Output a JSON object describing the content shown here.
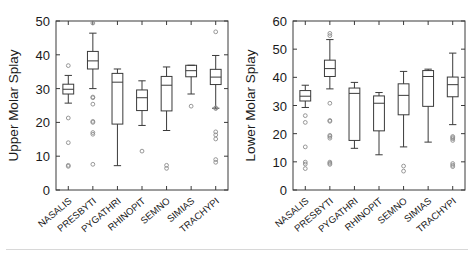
{
  "figure": {
    "title": "",
    "panel_count": 2,
    "background": "#ffffff",
    "line_color": "#3a3a3a"
  },
  "panels": [
    {
      "id": "upper-molar-splay",
      "ylabel": "Upper Molar Splay",
      "xlabel": "",
      "yticks": [
        "0",
        "10",
        "20",
        "30",
        "40",
        "50"
      ],
      "ylim": [
        0,
        50
      ],
      "categories": [
        "NASALIS",
        "PRESBYTI",
        "PYGATHRI",
        "RHINOPIT",
        "SEMNO",
        "SIMIAS",
        "TRACHYPI"
      ]
    },
    {
      "id": "lower-molar-splay",
      "ylabel": "Lower Molar Splay",
      "xlabel": "",
      "yticks": [
        "0",
        "10",
        "20",
        "30",
        "40",
        "50",
        "60"
      ],
      "ylim": [
        0,
        60
      ],
      "categories": [
        "NASALIS",
        "PRESBYTI",
        "PYGATHRI",
        "RHINOPIT",
        "SEMNO",
        "SIMIAS",
        "TRACHYPI"
      ]
    }
  ],
  "chart_data": [
    {
      "type": "boxplot",
      "title": "Upper Molar Splay",
      "xlabel": "",
      "ylabel": "Upper Molar Splay",
      "ylim": [
        0,
        50
      ],
      "yticks": [
        0,
        10,
        20,
        30,
        40,
        50
      ],
      "grid": false,
      "legend": null,
      "categories": [
        "NASALIS",
        "PRESBYTI",
        "PYGATHRI",
        "RHINOPIT",
        "SEMNO",
        "SIMIAS",
        "TRACHYPI"
      ],
      "boxes": [
        {
          "name": "NASALIS",
          "whisker_low": 25.7,
          "q1": 28.4,
          "median": 29.8,
          "q3": 31.3,
          "whisker_high": 33.9,
          "outliers": [
            36.8,
            21.3,
            14.0,
            7.3,
            7.0
          ]
        },
        {
          "name": "PRESBYTI",
          "whisker_low": 30.0,
          "q1": 35.8,
          "median": 38.2,
          "q3": 41.0,
          "whisker_high": 46.4,
          "outliers": [
            49.4,
            27.5,
            27.3,
            25.4,
            20.3,
            20.0,
            17.0,
            16.5,
            7.6
          ]
        },
        {
          "name": "PYGATHRI",
          "whisker_low": 7.2,
          "q1": 19.5,
          "median": 31.9,
          "q3": 34.5,
          "whisker_high": 35.8,
          "outliers": []
        },
        {
          "name": "RHINOPIT",
          "whisker_low": 19.1,
          "q1": 23.5,
          "median": 27.3,
          "q3": 29.6,
          "whisker_high": 32.3,
          "outliers": [
            11.5
          ]
        },
        {
          "name": "SEMNO",
          "whisker_low": 17.6,
          "q1": 23.4,
          "median": 31.0,
          "q3": 33.6,
          "whisker_high": 36.4,
          "outliers": [
            7.3,
            6.4
          ]
        },
        {
          "name": "SIMIAS",
          "whisker_low": 28.4,
          "q1": 33.5,
          "median": 35.3,
          "q3": 36.9,
          "whisker_high": 36.9,
          "outliers": [
            24.8
          ]
        },
        {
          "name": "TRACHYPI",
          "whisker_low": 24.2,
          "q1": 31.2,
          "median": 33.4,
          "q3": 35.7,
          "whisker_high": 39.8,
          "outliers": [
            46.8,
            24.3,
            24.1,
            17.2,
            16.3,
            15.1,
            9.0,
            8.2
          ]
        }
      ]
    },
    {
      "type": "boxplot",
      "title": "Lower Molar Splay",
      "xlabel": "",
      "ylabel": "Lower Molar Splay",
      "ylim": [
        0,
        60
      ],
      "yticks": [
        0,
        10,
        20,
        30,
        40,
        50,
        60
      ],
      "grid": false,
      "legend": null,
      "categories": [
        "NASALIS",
        "PRESBYTI",
        "PYGATHRI",
        "RHINOPIT",
        "SEMNO",
        "SIMIAS",
        "TRACHYPI"
      ],
      "boxes": [
        {
          "name": "NASALIS",
          "whisker_low": 29.3,
          "q1": 31.6,
          "median": 33.3,
          "q3": 35.3,
          "whisker_high": 37.2,
          "outliers": [
            26.4,
            24.0,
            15.3,
            9.9,
            9.2,
            7.6
          ]
        },
        {
          "name": "PRESBYTI",
          "whisker_low": 35.9,
          "q1": 40.3,
          "median": 43.1,
          "q3": 46.1,
          "whisker_high": 53.4,
          "outliers": [
            55.6,
            54.8,
            30.8,
            24.7,
            24.4,
            19.4,
            19.0,
            18.4,
            9.9,
            9.5,
            9.1
          ]
        },
        {
          "name": "PYGATHRI",
          "whisker_low": 14.8,
          "q1": 17.6,
          "median": 34.3,
          "q3": 36.2,
          "whisker_high": 38.2,
          "outliers": []
        },
        {
          "name": "RHINOPIT",
          "whisker_low": 12.5,
          "q1": 21.0,
          "median": 30.8,
          "q3": 33.4,
          "whisker_high": 34.6,
          "outliers": []
        },
        {
          "name": "SEMNO",
          "whisker_low": 15.3,
          "q1": 26.7,
          "median": 33.6,
          "q3": 37.7,
          "whisker_high": 42.1,
          "outliers": [
            8.5,
            6.7
          ]
        },
        {
          "name": "SIMIAS",
          "whisker_low": 17.0,
          "q1": 29.7,
          "median": 40.3,
          "q3": 42.4,
          "whisker_high": 42.9,
          "outliers": []
        },
        {
          "name": "TRACHYPI",
          "whisker_low": 23.2,
          "q1": 33.1,
          "median": 37.4,
          "q3": 40.1,
          "whisker_high": 48.6,
          "outliers": [
            19.0,
            18.6,
            18.2,
            17.6,
            9.4,
            8.8,
            8.3
          ]
        }
      ]
    }
  ]
}
